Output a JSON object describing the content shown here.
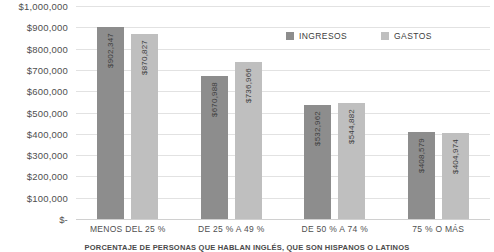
{
  "chart_data": {
    "type": "bar",
    "title": "",
    "subtitle": "",
    "caption": "PORCENTAJE DE PERSONAS QUE HABLAN INGLÉS, QUE SON HISPANOS O LATINOS",
    "xlabel": "",
    "ylabel": "",
    "ylim": [
      0,
      1000000
    ],
    "grid": true,
    "legend_position": "top-center",
    "categories": [
      "MENOS DEL 25 %",
      "DE 25 % A 49 %",
      "DE 50 % A 74 %",
      "75 % O MÁS"
    ],
    "y_ticks": [
      "$1,000,000",
      "$900,000",
      "$800,000",
      "$700,000",
      "$600,000",
      "$500,000",
      "$400,000",
      "$300,000",
      "$200,000",
      "$100,000",
      "$-"
    ],
    "y_tick_values": [
      1000000,
      900000,
      800000,
      700000,
      600000,
      500000,
      400000,
      300000,
      200000,
      100000,
      0
    ],
    "series": [
      {
        "name": "INGRESOS",
        "color": "#8d8d8d",
        "values": [
          902347,
          670988,
          532962,
          408579
        ],
        "labels": [
          "$902,347",
          "$670,988",
          "$532,962",
          "$408,579"
        ]
      },
      {
        "name": "GASTOS",
        "color": "#bfbfbf",
        "values": [
          870827,
          736966,
          544882,
          404974
        ],
        "labels": [
          "$870,827",
          "$736,966",
          "$544,882",
          "$404,974"
        ]
      }
    ]
  },
  "colors": {
    "ingresos": "#8d8d8d",
    "gastos": "#bfbfbf",
    "gridline": "#e2e2e2",
    "text": "#4a4a4a",
    "background": "#ffffff"
  }
}
